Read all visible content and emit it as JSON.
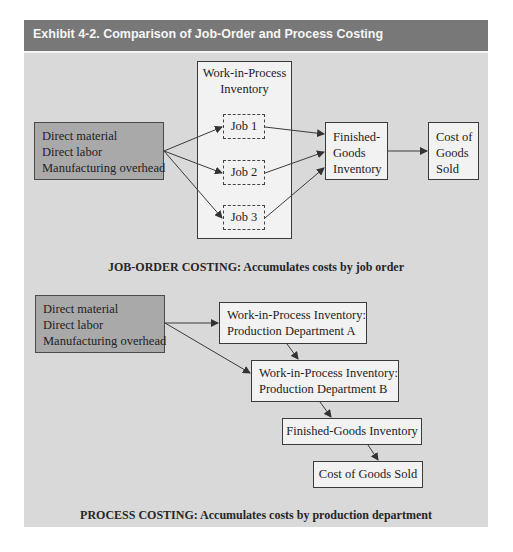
{
  "exhibit": {
    "title": "Exhibit 4-2. Comparison of Job-Order and Process Costing",
    "colors": {
      "header": "#787878",
      "panel": "#d9d9d9",
      "input_box": "#a9a9a9",
      "box": "#f2f2f2"
    }
  },
  "job_order": {
    "inputs": [
      "Direct material",
      "Direct labor",
      "Manufacturing overhead"
    ],
    "wip": {
      "title_line1": "Work-in-Process",
      "title_line2": "Inventory"
    },
    "jobs": [
      "Job 1",
      "Job 2",
      "Job 3"
    ],
    "finished_goods": [
      "Finished-",
      "Goods",
      "Inventory"
    ],
    "cogs": [
      "Cost of",
      "Goods",
      "Sold"
    ],
    "caption": "JOB-ORDER COSTING: Accumulates costs by job order"
  },
  "process": {
    "inputs": [
      "Direct material",
      "Direct labor",
      "Manufacturing overhead"
    ],
    "dept_a": [
      "Work-in-Process Inventory:",
      "Production Department A"
    ],
    "dept_b": [
      "Work-in-Process Inventory:",
      "Production Department B"
    ],
    "finished_goods": "Finished-Goods Inventory",
    "cogs": "Cost of Goods Sold",
    "caption": "PROCESS COSTING: Accumulates costs by production department"
  }
}
